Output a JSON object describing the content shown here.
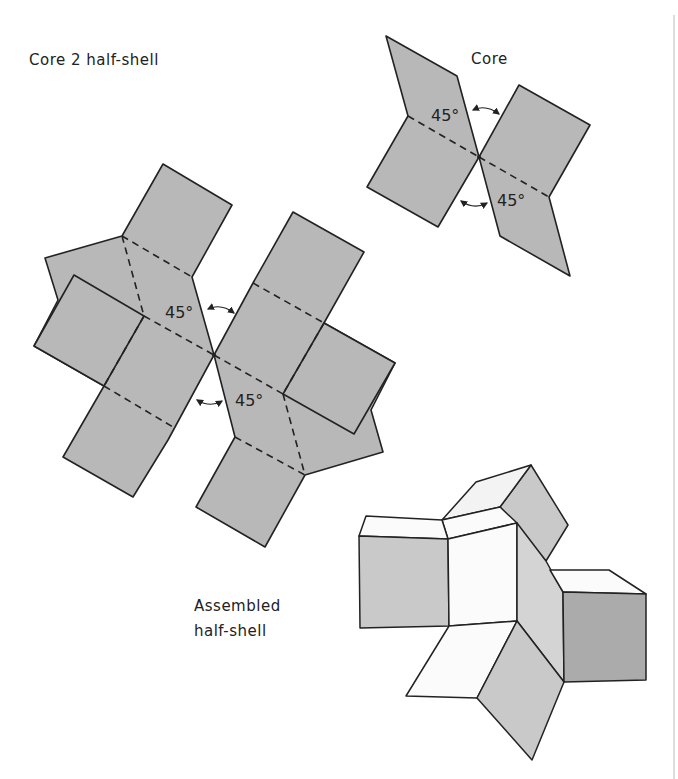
{
  "labels": {
    "half_shell_net": "Core 2 half-shell",
    "core_net": "Core",
    "assembled": [
      "Assembled",
      "half-shell"
    ]
  },
  "angles": {
    "core_upper": "45°",
    "core_lower": "45°",
    "shell_upper": "45°",
    "shell_lower": "45°"
  },
  "colors": {
    "net_fill": "#b8b8b8",
    "line": "#222222",
    "face_light": "#f3f3f3",
    "face_mid": "#c9c9c9",
    "face_dark": "#ababab",
    "divider": "#bbbbbb"
  }
}
